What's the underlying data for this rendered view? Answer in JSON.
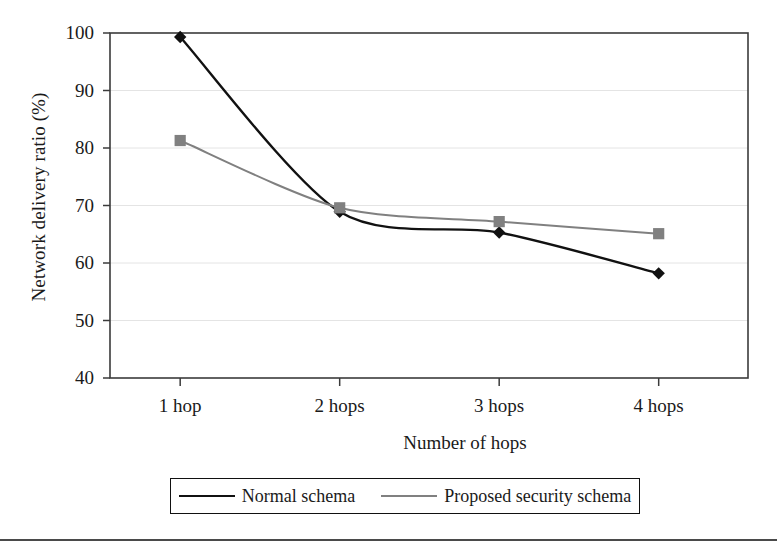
{
  "chart_data": {
    "type": "line",
    "title": "",
    "xlabel": "Number of hops",
    "ylabel": "Network delivery ratio (%)",
    "categories": [
      "1 hop",
      "2 hops",
      "3 hops",
      "4 hops"
    ],
    "ylim": [
      40,
      100
    ],
    "yticks": [
      40,
      50,
      60,
      70,
      80,
      90,
      100
    ],
    "ytick_labels": [
      "40",
      "50",
      "60",
      "70",
      "80",
      "90",
      "100"
    ],
    "grid": "horizontal",
    "legend_position": "bottom",
    "series": [
      {
        "name": "Normal schema",
        "values": [
          99.3,
          68.9,
          65.3,
          58.2
        ],
        "color": "#111111",
        "marker": "diamond"
      },
      {
        "name": "Proposed security schema",
        "values": [
          81.3,
          69.6,
          67.2,
          65.1
        ],
        "color": "#808080",
        "marker": "square"
      }
    ]
  },
  "axes": {
    "y_title": "Network delivery ratio (%)",
    "x_title": "Number of hops"
  },
  "legend": {
    "entries": [
      {
        "label": "Normal schema",
        "marker": "diamond-marker-icon",
        "color": "#111111"
      },
      {
        "label": "Proposed security schema",
        "marker": "square-marker-icon",
        "color": "#808080"
      }
    ]
  },
  "colors": {
    "series_normal": "#111111",
    "series_proposed": "#808080",
    "axis": "#3b3b3b",
    "grid": "#e4e4e4",
    "background": "#ffffff"
  }
}
